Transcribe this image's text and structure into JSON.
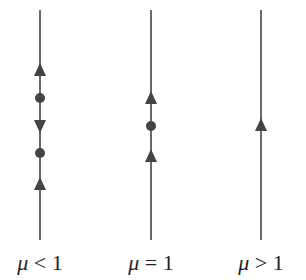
{
  "diagram": {
    "type": "phase-line bifurcation diagram",
    "line_color": "#444444",
    "marker_color": "#444444",
    "panels": [
      {
        "label_symbol": "μ",
        "label_relation": "< 1",
        "x": 40,
        "arrows": [
          {
            "y": 70,
            "direction": "up"
          },
          {
            "y": 126,
            "direction": "down"
          },
          {
            "y": 184,
            "direction": "up"
          }
        ],
        "fixed_points": [
          {
            "y": 98
          },
          {
            "y": 153
          }
        ]
      },
      {
        "label_symbol": "μ",
        "label_relation": "= 1",
        "x": 151,
        "arrows": [
          {
            "y": 98,
            "direction": "up"
          },
          {
            "y": 156,
            "direction": "up"
          }
        ],
        "fixed_points": [
          {
            "y": 126
          }
        ]
      },
      {
        "label_symbol": "μ",
        "label_relation": "> 1",
        "x": 261,
        "arrows": [
          {
            "y": 125,
            "direction": "up"
          }
        ],
        "fixed_points": []
      }
    ],
    "line_top": 10,
    "line_bottom": 240
  }
}
